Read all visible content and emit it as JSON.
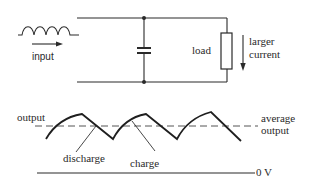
{
  "circuit": {
    "input_label": "input",
    "load_label": "load",
    "current_label_line1": "larger",
    "current_label_line2": "current",
    "components": [
      "rectified-input-source",
      "smoothing-capacitor",
      "load-resistor"
    ]
  },
  "waveform": {
    "output_label": "output",
    "average_label_line1": "average",
    "average_label_line2": "output",
    "discharge_label": "discharge",
    "charge_label": "charge",
    "zero_label": "0 V"
  },
  "colors": {
    "line": "#2a2a2a",
    "background": "#ffffff"
  }
}
